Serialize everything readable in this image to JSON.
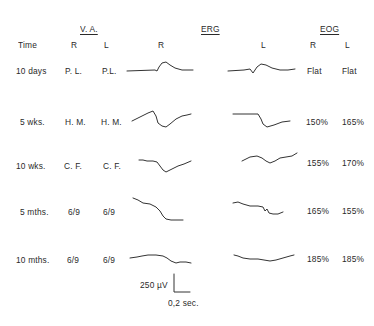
{
  "headers": {
    "va": "V. A.",
    "erg": "ERG",
    "eog": "EOG"
  },
  "columns": {
    "time": "Time",
    "va_r": "R",
    "va_l": "L",
    "erg_r": "R",
    "erg_l": "L",
    "eog_r": "R",
    "eog_l": "L"
  },
  "rows": [
    {
      "time": "10 days",
      "va_r": "P. L.",
      "va_l": "P.L.",
      "eog_r": "Flat",
      "eog_l": "Flat",
      "erg_r_trace": "M127,71 L155,70 L157,71 L159,67 L162,63 L166,62 L170,65 L175,68 L182,70 L193,70",
      "erg_l_trace": "M228,71 L244,70 L250,69 L253,73 L257,67 L261,64 L266,65 L272,68 L280,70 L288,70 L295,69"
    },
    {
      "time": "5 wks.",
      "va_r": "H. M.",
      "va_l": "H. M.",
      "eog_r": "150%",
      "eog_l": "165%",
      "erg_r_trace": "M132,121 L140,117 L148,113 L153,111 L156,116 L158,123 L162,126 L166,127 L170,124 L176,119 L182,116 L187,115 L191,114",
      "erg_l_trace": "M233,114 L250,114 L258,114 L261,119 L263,124 L267,127 L274,125 L282,122 L290,121"
    },
    {
      "time": "10 wks.",
      "va_r": "C. F.",
      "va_l": "C. F.",
      "eog_r": "155%",
      "eog_l": "170%",
      "erg_r_trace": "M139,160 L143,160 L147,161 L153,161 L157,162 L160,166 L163,170 L166,172 L172,169 L178,166 L184,164 L191,161",
      "erg_l_trace": "M242,161 L250,157 L257,156 L262,158 L266,161 L270,163 L275,161 L280,158 L286,157 L292,156 L297,153"
    },
    {
      "time": "5 mths.",
      "va_r": "6/9",
      "va_l": "6/9",
      "eog_r": "165%",
      "eog_l": "155%",
      "erg_r_trace": "M133,198 L138,200 L143,203 L150,204 L156,207 L160,211 L163,216 L166,219 L171,220 L183,220",
      "erg_l_trace": "M233,203 L238,202 L243,204 L250,206 L258,206 L263,207 L265,211 L267,209 L269,213 L273,214 L278,214 L283,212"
    },
    {
      "time": "10 mths.",
      "va_r": "6/9",
      "va_l": "6/9",
      "eog_r": "185%",
      "eog_l": "185%",
      "erg_r_trace": "M130,258 L137,257 L142,256 L148,255 L156,255 L163,256 L167,258 L171,261 L176,263 L180,262 L186,262 L191,263",
      "erg_l_trace": "M234,255 L238,256 L243,258 L250,259 L258,259 L264,260 L270,261 L276,260 L283,258 L290,256 L294,255"
    }
  ],
  "scale_bar": {
    "voltage_label": "250 µV",
    "time_label": "0,2 sec."
  }
}
